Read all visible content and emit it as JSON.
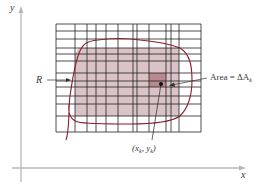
{
  "figure": {
    "axes": {
      "x_label": "x",
      "y_label": "y",
      "axis_color": "#b8b8b8"
    },
    "grid": {
      "line_color": "#222222",
      "left": 56,
      "right": 201,
      "top": 24,
      "bottom": 132,
      "vertical_lines": [
        56,
        75,
        87,
        96,
        106,
        118,
        133,
        137,
        149,
        166,
        171,
        179,
        201
      ],
      "horizontal_lines": [
        24,
        31,
        39,
        48,
        54,
        61,
        73,
        81,
        87,
        96,
        104,
        116,
        132
      ]
    },
    "region": {
      "label": "R",
      "boundary_color": "#8b1a2b",
      "fill_color": "#d9c3c6"
    },
    "highlighted_cell": {
      "label_main": "Area = ΔA",
      "label_sub": "k",
      "fill_color": "#b88a90"
    },
    "sample_point": {
      "label_open": "(x",
      "label_sub1": "k",
      "label_mid": ", y",
      "label_sub2": "k",
      "label_close": ")",
      "color": "#111111"
    }
  }
}
